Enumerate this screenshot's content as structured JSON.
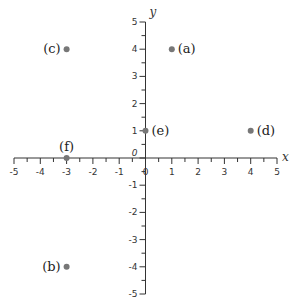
{
  "chart_data": {
    "type": "scatter",
    "title": "",
    "xlabel": "x",
    "ylabel": "y",
    "xlim": [
      -5,
      5
    ],
    "ylim": [
      -5,
      5
    ],
    "grid": false,
    "x_ticks": [
      -5,
      -4,
      -3,
      -2,
      -1,
      0,
      1,
      2,
      3,
      4,
      5
    ],
    "y_ticks": [
      -5,
      -4,
      -3,
      -2,
      -1,
      0,
      1,
      2,
      3,
      4,
      5
    ],
    "origin_label": "0",
    "points": [
      {
        "label": "(a)",
        "x": 1,
        "y": 4,
        "label_side": "right"
      },
      {
        "label": "(b)",
        "x": -3,
        "y": -4,
        "label_side": "left"
      },
      {
        "label": "(c)",
        "x": -3,
        "y": 4,
        "label_side": "left"
      },
      {
        "label": "(d)",
        "x": 4,
        "y": 1,
        "label_side": "right"
      },
      {
        "label": "(e)",
        "x": 0,
        "y": 1,
        "label_side": "right"
      },
      {
        "label": "(f)",
        "x": -3,
        "y": 0,
        "label_side": "above"
      }
    ],
    "colors": {
      "axis": "#333333",
      "point": "#777777"
    }
  }
}
